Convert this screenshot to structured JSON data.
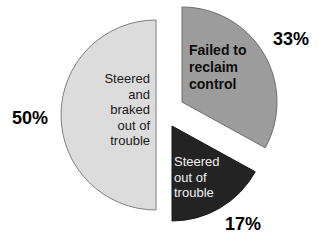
{
  "chart_data": {
    "type": "pie",
    "title": "",
    "unit": "%",
    "direction": "clockwise",
    "start_angle": "12-oclock",
    "exploded": true,
    "legend": "none",
    "slices": [
      {
        "label": "Failed to reclaim control",
        "label_lines": "Failed to\nreclaim\ncontrol",
        "value": 33,
        "value_label": "33%",
        "color": "#9c9c9c",
        "text_color": "#0d0d0d"
      },
      {
        "label": "Steered out of trouble",
        "label_lines": "Steered\nout of\ntrouble",
        "value": 17,
        "value_label": "17%",
        "color": "#232323",
        "text_color": "#f0f0f0"
      },
      {
        "label": "Steered and braked out of trouble",
        "label_lines": "Steered\nand\nbraked\nout of\ntrouble",
        "value": 50,
        "value_label": "50%",
        "color": "#dcdcdc",
        "text_color": "#1a1a1a"
      }
    ]
  }
}
